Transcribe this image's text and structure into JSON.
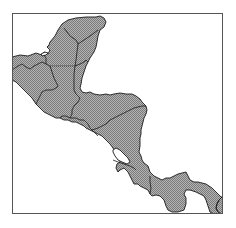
{
  "map": {
    "region": "Central America",
    "style": "grayscale halftone",
    "colors": {
      "background": "#ffffff",
      "land_fill_light": "#b4b4b4",
      "land_fill_dark": "#7a7a7a",
      "border": "#1a1a1a",
      "frame": "#555555",
      "water": "#ffffff"
    },
    "frame": {
      "x": 12,
      "y": 13,
      "width": 211,
      "height": 201
    },
    "countries": [
      {
        "id": "mexico-yucatan",
        "name": "Mexico (Yucatán)"
      },
      {
        "id": "mexico-chiapas",
        "name": "Mexico (Chiapas)"
      },
      {
        "id": "guatemala",
        "name": "Guatemala"
      },
      {
        "id": "belize",
        "name": "Belize"
      },
      {
        "id": "el-salvador",
        "name": "El Salvador"
      },
      {
        "id": "honduras",
        "name": "Honduras"
      },
      {
        "id": "nicaragua",
        "name": "Nicaragua"
      },
      {
        "id": "costa-rica",
        "name": "Costa Rica"
      },
      {
        "id": "panama",
        "name": "Panama"
      },
      {
        "id": "colombia",
        "name": "Colombia (edge)"
      }
    ],
    "lakes": [
      {
        "id": "lake-nicaragua",
        "name": "Lake Nicaragua"
      }
    ]
  }
}
